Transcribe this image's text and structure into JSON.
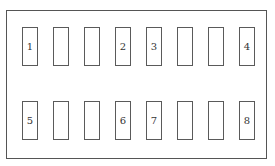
{
  "diagram": {
    "rows": [
      {
        "name": "top-row",
        "slots": [
          {
            "label": "1"
          },
          {
            "label": ""
          },
          {
            "label": ""
          },
          {
            "label": "2"
          },
          {
            "label": "3"
          },
          {
            "label": ""
          },
          {
            "label": ""
          },
          {
            "label": "4"
          }
        ]
      },
      {
        "name": "bottom-row",
        "slots": [
          {
            "label": "5"
          },
          {
            "label": ""
          },
          {
            "label": ""
          },
          {
            "label": "6"
          },
          {
            "label": "7"
          },
          {
            "label": ""
          },
          {
            "label": ""
          },
          {
            "label": "8"
          }
        ]
      }
    ],
    "colors": {
      "stroke": "#555555",
      "background": "#ffffff",
      "text": "#333333"
    }
  }
}
